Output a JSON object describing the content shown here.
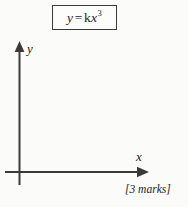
{
  "figure": {
    "background_color": "#fbfbfa",
    "ink_color": "#3a3a3a",
    "equation_box": {
      "lhs": "y",
      "operator": "=",
      "coefficient": "k",
      "variable": "x",
      "exponent": "3",
      "full_text": "y = kx3"
    },
    "axes": {
      "y_axis_label": "y",
      "x_axis_label": "x",
      "y_axis_arrow": "arrow-up",
      "x_axis_arrow": "arrow-right"
    },
    "marks": "[3 marks]"
  }
}
